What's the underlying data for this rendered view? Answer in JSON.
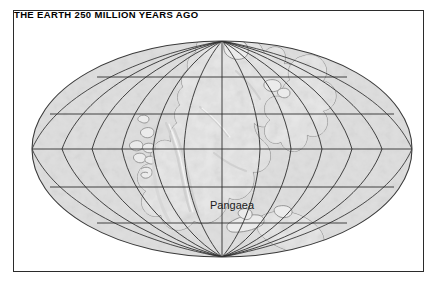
{
  "figure": {
    "title": "THE EARTH 250 MILLION YEARS AGO",
    "frame_color": "#2b2b2b",
    "background_color": "#ffffff"
  },
  "map": {
    "type": "paleogeographic-world-map",
    "projection": "elliptical (Mollweide-style)",
    "ocean_color": "#dedede",
    "land_color": "#eaeaea",
    "coastline_color": "#8a8a8a",
    "graticule_color": "#2f2f2f",
    "outline_color": "#3a3a3a",
    "labels": [
      {
        "text": "Pangaea",
        "x": 218,
        "y": 198
      }
    ],
    "graticule": {
      "meridian_interval_deg": 30,
      "parallel_interval_deg": 30,
      "parallels_count": 5,
      "meridians_count": 13
    },
    "geology": {
      "supercontinent": "Pangaea",
      "age_label": "250 million years ago",
      "era": "Permian-Triassic"
    }
  }
}
